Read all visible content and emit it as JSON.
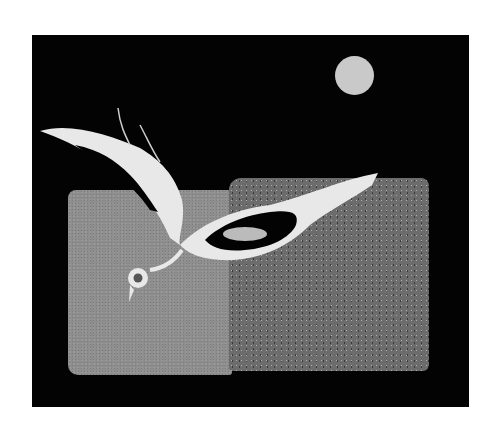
{
  "artwork": {
    "subject": "bird in flight over sand textures with moon",
    "elements": [
      "black-background",
      "moon",
      "fine-sand-panel",
      "coarse-sand-panel",
      "white-bird"
    ],
    "colors": {
      "background": "#030303",
      "moon": "#c9c9c9",
      "fine_sand": "#8e8e8e",
      "coarse_sand": "#6c6c6c",
      "bird": "#e8e8e8",
      "page": "#ffffff"
    }
  }
}
